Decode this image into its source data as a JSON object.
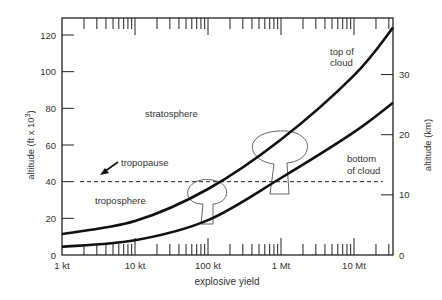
{
  "chart_data": {
    "type": "line",
    "title": "",
    "xlabel": "explosive yield",
    "ylabel": "altitude (ft x 10^3)",
    "ylabel_parts": {
      "main": "altitude (ft x 10",
      "sup": "3",
      "close": ")"
    },
    "y2label": "altitude (km)",
    "xscale": "log",
    "x_ticks": [
      {
        "label": "1 kt",
        "kt": 1
      },
      {
        "label": "10 kt",
        "kt": 10
      },
      {
        "label": "100 kt",
        "kt": 100
      },
      {
        "label": "1 Mt",
        "kt": 1000
      },
      {
        "label": "10 Mt",
        "kt": 10000
      }
    ],
    "xlim_kt": [
      1,
      45000
    ],
    "y_ticks": [
      0,
      20,
      40,
      60,
      80,
      100,
      120
    ],
    "ylim": [
      0,
      120
    ],
    "y2_ticks": [
      0,
      10,
      20,
      30
    ],
    "grid": false,
    "legend": "none",
    "series": [
      {
        "name": "top of cloud",
        "x_kt": [
          1,
          10,
          100,
          1000,
          10000,
          45000
        ],
        "values": [
          11.5,
          18.5,
          36,
          63,
          98,
          124
        ]
      },
      {
        "name": "bottom of cloud",
        "x_kt": [
          1,
          10,
          100,
          1000,
          10000,
          45000
        ],
        "values": [
          4.5,
          8,
          19,
          42,
          67,
          83
        ]
      }
    ],
    "reference_lines": [
      {
        "name": "tropopause",
        "y": 40,
        "style": "dashed"
      }
    ],
    "annotations": [
      {
        "text": "stratosphere"
      },
      {
        "text": "tropopause"
      },
      {
        "text": "troposphere"
      },
      {
        "text": "top of cloud"
      },
      {
        "text": "bottom of cloud"
      }
    ]
  },
  "labels": {
    "stratosphere": "stratosphere",
    "tropopause": "tropopause",
    "troposphere": "troposphere",
    "top_line1": "top of",
    "top_line2": "cloud",
    "bottom_line1": "bottom",
    "bottom_line2": "of cloud"
  }
}
